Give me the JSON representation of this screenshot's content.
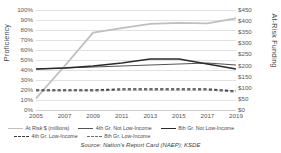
{
  "chart_data": {
    "type": "line",
    "title": "",
    "xlabel": "",
    "ylabel": "Proficiency",
    "y2label": "At-Risk Funding",
    "x": [
      2005,
      2007,
      2009,
      2011,
      2013,
      2015,
      2017,
      2019
    ],
    "categories": [
      "2005",
      "2007",
      "2009",
      "2011",
      "2013",
      "2015",
      "2017",
      "2019"
    ],
    "ylim": [
      0,
      100
    ],
    "yticks": [
      "0%",
      "10%",
      "20%",
      "30%",
      "40%",
      "50%",
      "60%",
      "70%",
      "80%",
      "90%",
      "100%"
    ],
    "y2lim": [
      0,
      450
    ],
    "y2ticks": [
      "$0",
      "$50",
      "$100",
      "$150",
      "$200",
      "$250",
      "$300",
      "$350",
      "$400",
      "$450"
    ],
    "grid": true,
    "legend_position": "bottom",
    "series": [
      {
        "name": "At Risk $ (millions)",
        "axis": "right",
        "color": "#bfbfbf",
        "style": "solid",
        "width": 1.8,
        "values": [
          52,
          198,
          348,
          368,
          388,
          392,
          390,
          412
        ]
      },
      {
        "name": "4th Gr. Not Low-Income",
        "axis": "left",
        "color": "#555555",
        "style": "solid",
        "width": 1.1,
        "values": [
          41,
          42,
          43,
          44,
          45,
          46,
          47,
          45
        ]
      },
      {
        "name": "8th Gr. Not Low-Income",
        "axis": "left",
        "color": "#2b2b2b",
        "style": "solid",
        "width": 1.4,
        "values": [
          41,
          42,
          44,
          47,
          51,
          51,
          46,
          41
        ]
      },
      {
        "name": "4th Gr. Low-Income",
        "axis": "left",
        "color": "#3a3a3a",
        "style": "dashed",
        "width": 1.4,
        "values": [
          20,
          20,
          20,
          21,
          21,
          21,
          21,
          19
        ]
      },
      {
        "name": "8th Gr. Low-Income",
        "axis": "left",
        "color": "#6e6e6e",
        "style": "dashed",
        "width": 1.2,
        "values": [
          19,
          19,
          19,
          20,
          20,
          20,
          20,
          18
        ]
      }
    ],
    "source": "Source: Nation's Report Card (NAEP); KSDE"
  },
  "legend": {
    "items": [
      {
        "label": "At Risk $ (millions)"
      },
      {
        "label": "4th Gr. Not Low-Income"
      },
      {
        "label": "8th Gr. Not Low-Income"
      },
      {
        "label": "4th Gr. Low-Income"
      },
      {
        "label": "8th Gr. Low-Income"
      }
    ]
  }
}
